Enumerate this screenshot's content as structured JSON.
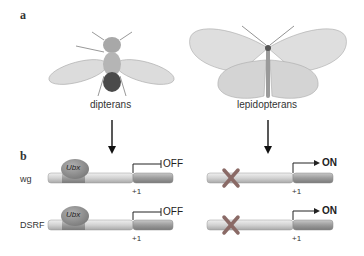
{
  "panel_a": {
    "label": "a",
    "left_organism": "dipterans",
    "right_organism": "lepidopterans"
  },
  "panel_b": {
    "label": "b",
    "rows": [
      {
        "gene": "wg",
        "dipteran_state": "OFF",
        "lepidopteran_state": "ON",
        "tss": "+1",
        "repressor": "Ubx"
      },
      {
        "gene": "DSRF",
        "dipteran_state": "OFF",
        "lepidopteran_state": "ON",
        "tss": "+1",
        "repressor": "Ubx"
      }
    ]
  },
  "colors": {
    "repressor": "#8a8a8a",
    "cross": "#8a6a66",
    "dna_light": "#d6d6d6",
    "dna_dark": "#9a9a9a"
  }
}
